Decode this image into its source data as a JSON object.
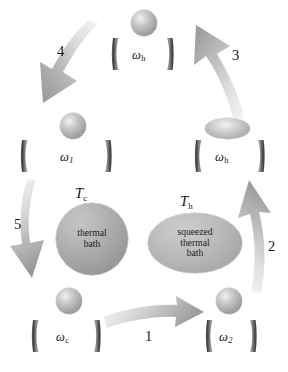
{
  "figure": {
    "type": "cycle-diagram",
    "width": 288,
    "height": 372,
    "background_color": "#ffffff"
  },
  "palette": {
    "arrow_light": "#f0f0f0",
    "arrow_dark": "#9a9a9a",
    "mirror_dark": "#4a4a4a",
    "mirror_light": "#a8a8a8",
    "text": "#111111",
    "sphere_light": "#f2f2f2",
    "sphere_dark": "#8b8b8b",
    "bath_fill": "#a6a6a6"
  },
  "stages": [
    {
      "id": "stage-top",
      "label": "ω",
      "subscript": "h",
      "mode": "sphere",
      "position": "top-center",
      "description": "thermalized mode in cavity of frequency omega h"
    },
    {
      "id": "stage-left",
      "label": "ω",
      "subscript": "1",
      "mode": "sphere",
      "position": "middle-left",
      "description": "mode in cavity of frequency omega 1"
    },
    {
      "id": "stage-right",
      "label": "ω",
      "subscript": "h",
      "mode": "squeezed",
      "position": "middle-right",
      "description": "squeezed mode in cavity of frequency omega h"
    },
    {
      "id": "stage-bottom-left",
      "label": "ω",
      "subscript": "c",
      "mode": "sphere",
      "position": "bottom-left",
      "description": "mode in cavity of frequency omega c"
    },
    {
      "id": "stage-bottom-right",
      "label": "ω",
      "subscript": "2",
      "mode": "sphere",
      "position": "bottom-right",
      "description": "mode in cavity of frequency omega 2"
    }
  ],
  "baths": [
    {
      "id": "bath-cold",
      "temperature_symbol": "T",
      "temperature_subscript": "c",
      "lines": [
        "thermal",
        "bath"
      ],
      "shape": "circle"
    },
    {
      "id": "bath-hot",
      "temperature_symbol": "T",
      "temperature_subscript": "h",
      "lines": [
        "squeezed",
        "thermal",
        "bath"
      ],
      "shape": "ellipse"
    }
  ],
  "steps": [
    {
      "id": "step-1",
      "number": "1",
      "direction": "right",
      "from": "stage-bottom-left",
      "to": "stage-bottom-right"
    },
    {
      "id": "step-2",
      "number": "2",
      "direction": "up",
      "from": "stage-bottom-right",
      "to": "stage-right"
    },
    {
      "id": "step-3",
      "number": "3",
      "direction": "up-left",
      "from": "stage-right",
      "to": "stage-top"
    },
    {
      "id": "step-4",
      "number": "4",
      "direction": "down-left",
      "from": "stage-top",
      "to": "stage-left"
    },
    {
      "id": "step-5",
      "number": "5",
      "direction": "down",
      "from": "stage-left",
      "to": "stage-bottom-left"
    }
  ]
}
